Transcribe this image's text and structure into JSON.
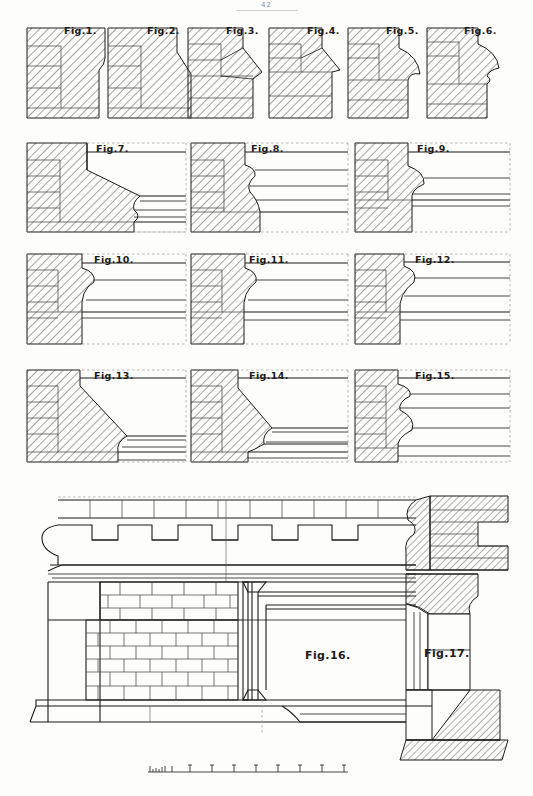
{
  "plate": {
    "title": "Architectural masonry profiles plate",
    "page_number": "42",
    "ink_color": "#1b1b1b",
    "hatch_color": "#3a3a3a",
    "paper_color": "#fdfdfb",
    "dashed_color": "#8f8f8f"
  },
  "figures": [
    {
      "id": "fig1",
      "label": "Fig.1.",
      "x": 76,
      "y": 33,
      "row": 1,
      "kind": "masonry-profile-section",
      "desc": "plain chamfered edge"
    },
    {
      "id": "fig2",
      "label": "Fig.2.",
      "x": 157,
      "y": 33,
      "row": 1,
      "kind": "masonry-profile-section",
      "desc": "splayed chamfer"
    },
    {
      "id": "fig3",
      "label": "Fig.3.",
      "x": 238,
      "y": 33,
      "row": 1,
      "kind": "masonry-profile-section",
      "desc": "double splay with drip"
    },
    {
      "id": "fig4",
      "label": "Fig.4.",
      "x": 317,
      "y": 33,
      "row": 1,
      "kind": "masonry-profile-section",
      "desc": "splay with fillet"
    },
    {
      "id": "fig5",
      "label": "Fig.5.",
      "x": 396,
      "y": 33,
      "row": 1,
      "kind": "masonry-profile-section",
      "desc": "ovolo with undercut"
    },
    {
      "id": "fig6",
      "label": "Fig.6.",
      "x": 473,
      "y": 33,
      "row": 1,
      "kind": "masonry-profile-section",
      "desc": "roll mould with throating"
    },
    {
      "id": "fig7",
      "label": "Fig.7.",
      "x": 113,
      "y": 150,
      "row": 2,
      "kind": "cornice-profile",
      "desc": "cavetto cornice on corbel course"
    },
    {
      "id": "fig8",
      "label": "Fig.8.",
      "x": 268,
      "y": 150,
      "row": 2,
      "kind": "cornice-profile",
      "desc": "ogee with bead"
    },
    {
      "id": "fig9",
      "label": "Fig.9.",
      "x": 434,
      "y": 150,
      "row": 2,
      "kind": "cornice-profile",
      "desc": "torus over cyma"
    },
    {
      "id": "fig10",
      "label": "Fig.10.",
      "x": 113,
      "y": 261,
      "row": 3,
      "kind": "cornice-profile",
      "desc": "bead over large cavetto"
    },
    {
      "id": "fig11",
      "label": "Fig.11.",
      "x": 268,
      "y": 261,
      "row": 3,
      "kind": "cornice-profile",
      "desc": "bead and cyma recta"
    },
    {
      "id": "fig12",
      "label": "Fig.12.",
      "x": 434,
      "y": 261,
      "row": 3,
      "kind": "cornice-profile",
      "desc": "roll with deep scotia"
    },
    {
      "id": "fig13",
      "label": "Fig.13.",
      "x": 113,
      "y": 376,
      "row": 4,
      "kind": "cornice-profile",
      "desc": "splayed corona with roll"
    },
    {
      "id": "fig14",
      "label": "Fig.14.",
      "x": 268,
      "y": 376,
      "row": 4,
      "kind": "cornice-profile",
      "desc": "splay with bead and fillet"
    },
    {
      "id": "fig15",
      "label": "Fig.15.",
      "x": 434,
      "y": 376,
      "row": 4,
      "kind": "cornice-profile",
      "desc": "compound bead mouldings"
    },
    {
      "id": "fig16",
      "label": "Fig.16.",
      "x": 333,
      "y": 657,
      "row": 5,
      "kind": "wall-elevation",
      "desc": "parapet wall elevation with crenellated coping, ashlar and brick coursing"
    },
    {
      "id": "fig17",
      "label": "Fig.17.",
      "x": 447,
      "y": 655,
      "row": 5,
      "kind": "wall-section",
      "desc": "vertical section through parapet, cornice and plinth"
    }
  ],
  "scale_bar": {
    "name": "graphic-scale",
    "x": 148,
    "y": 770,
    "width": 200,
    "major_ticks": 9,
    "subdivided_leading_unit": true,
    "unit_marks": [
      "",
      "",
      "",
      "",
      "",
      "",
      "",
      "",
      ""
    ]
  }
}
